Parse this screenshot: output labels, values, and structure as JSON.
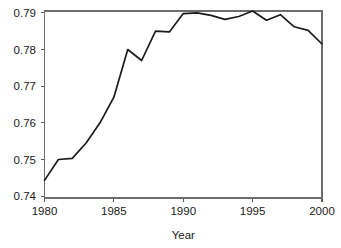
{
  "chart_data": {
    "type": "line",
    "title": "",
    "subtitle": "",
    "xlabel": "Year",
    "ylabel": "",
    "x": [
      1980,
      1981,
      1982,
      1983,
      1984,
      1985,
      1986,
      1987,
      1988,
      1989,
      1990,
      1991,
      1992,
      1993,
      1994,
      1995,
      1996,
      1997,
      1998,
      1999,
      2000
    ],
    "values": [
      0.7443,
      0.75,
      0.7503,
      0.7545,
      0.76,
      0.767,
      0.78,
      0.777,
      0.785,
      0.7848,
      0.7898,
      0.79,
      0.7893,
      0.7882,
      0.789,
      0.7905,
      0.788,
      0.7895,
      0.7862,
      0.7852,
      0.7815
    ],
    "series": [
      {
        "name": "",
        "color": "#1b1b1b",
        "values": [
          0.7443,
          0.75,
          0.7503,
          0.7545,
          0.76,
          0.767,
          0.78,
          0.777,
          0.785,
          0.7848,
          0.7898,
          0.79,
          0.7893,
          0.7882,
          0.789,
          0.7905,
          0.788,
          0.7895,
          0.7862,
          0.7852,
          0.7815
        ]
      }
    ],
    "xlim": [
      1980,
      2000
    ],
    "ylim": [
      0.7395,
      0.7905
    ],
    "xticks": [
      1980,
      1985,
      1990,
      1995,
      2000
    ],
    "xtick_labels": [
      "1980",
      "1985",
      "1990",
      "1995",
      "2000"
    ],
    "yticks": [
      0.74,
      0.75,
      0.76,
      0.77,
      0.78,
      0.79
    ],
    "ytick_labels": [
      "0.74",
      "0.75",
      "0.76",
      "0.77",
      "0.78",
      "0.79"
    ],
    "grid": false,
    "legend": false,
    "legend_position": "none",
    "annotations": []
  },
  "axes": {
    "x_axis_title": "Year",
    "y_axis_title": ""
  }
}
